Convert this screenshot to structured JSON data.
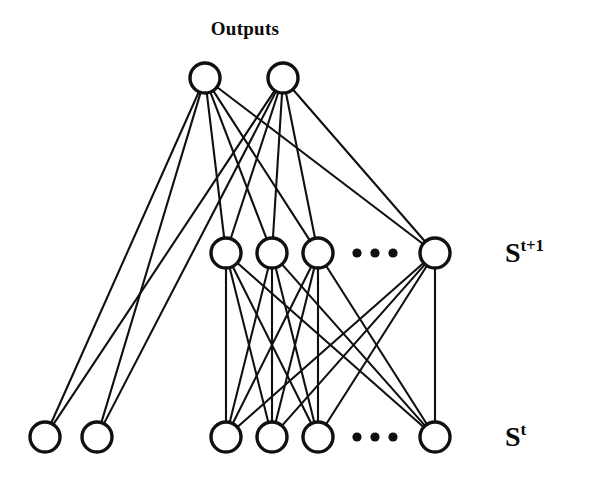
{
  "figure": {
    "kind": "neural-network-diagram",
    "title": "Outputs",
    "background_color": "#ffffff",
    "ink_color": "#101010",
    "width": 591,
    "height": 481
  },
  "labels": {
    "outputs_title": "Outputs",
    "state_next_base": "S",
    "state_next_sup": "t+1",
    "state_current_base": "S",
    "state_current_sup": "t",
    "ellipsis": "• • •"
  },
  "chart_data": {
    "type": "diagram",
    "title": "Outputs",
    "layers": [
      {
        "id": "outputs",
        "label": "Outputs",
        "label_position": "top-center",
        "y": 78,
        "node_radius": 15,
        "nodes": [
          {
            "id": "o1",
            "x": 205,
            "y": 78
          },
          {
            "id": "o2",
            "x": 283,
            "y": 78
          }
        ],
        "ellipsis": null
      },
      {
        "id": "state_next",
        "label": "S^t+1",
        "label_position": "right",
        "y": 253,
        "node_radius": 15,
        "nodes": [
          {
            "id": "h1",
            "x": 226,
            "y": 253
          },
          {
            "id": "h2",
            "x": 272,
            "y": 253
          },
          {
            "id": "h3",
            "x": 318,
            "y": 253
          },
          {
            "id": "h4",
            "x": 435,
            "y": 253
          }
        ],
        "ellipsis": {
          "x": [
            357,
            375,
            393
          ],
          "y": 253,
          "radius": 4.6
        }
      },
      {
        "id": "state_current",
        "label": "S^t",
        "label_position": "right",
        "y": 437,
        "node_radius": 15,
        "nodes": [
          {
            "id": "s1",
            "x": 226,
            "y": 437
          },
          {
            "id": "s2",
            "x": 272,
            "y": 437
          },
          {
            "id": "s3",
            "x": 318,
            "y": 437
          },
          {
            "id": "s4",
            "x": 435,
            "y": 437
          }
        ],
        "ellipsis": {
          "x": [
            357,
            375,
            393
          ],
          "y": 437,
          "radius": 4.6
        }
      },
      {
        "id": "extra_inputs",
        "label": "",
        "label_position": "none",
        "y": 437,
        "node_radius": 15,
        "nodes": [
          {
            "id": "e1",
            "x": 45,
            "y": 437
          },
          {
            "id": "e2",
            "x": 97,
            "y": 437
          }
        ],
        "ellipsis": null
      }
    ],
    "edges": [
      {
        "from": "o1",
        "to": "h1"
      },
      {
        "from": "o1",
        "to": "h2"
      },
      {
        "from": "o1",
        "to": "h3"
      },
      {
        "from": "o1",
        "to": "h4"
      },
      {
        "from": "o1",
        "to": "e1"
      },
      {
        "from": "o1",
        "to": "e2"
      },
      {
        "from": "o2",
        "to": "h1"
      },
      {
        "from": "o2",
        "to": "h2"
      },
      {
        "from": "o2",
        "to": "h3"
      },
      {
        "from": "o2",
        "to": "h4"
      },
      {
        "from": "o2",
        "to": "e1"
      },
      {
        "from": "o2",
        "to": "e2"
      },
      {
        "from": "h1",
        "to": "s1"
      },
      {
        "from": "h1",
        "to": "s2"
      },
      {
        "from": "h1",
        "to": "s3"
      },
      {
        "from": "h1",
        "to": "s4"
      },
      {
        "from": "h2",
        "to": "s1"
      },
      {
        "from": "h2",
        "to": "s2"
      },
      {
        "from": "h2",
        "to": "s3"
      },
      {
        "from": "h2",
        "to": "s4"
      },
      {
        "from": "h3",
        "to": "s1"
      },
      {
        "from": "h3",
        "to": "s2"
      },
      {
        "from": "h3",
        "to": "s3"
      },
      {
        "from": "h3",
        "to": "s4"
      },
      {
        "from": "h4",
        "to": "s1"
      },
      {
        "from": "h4",
        "to": "s2"
      },
      {
        "from": "h4",
        "to": "s3"
      },
      {
        "from": "h4",
        "to": "s4"
      }
    ],
    "title_position": {
      "x": 245,
      "y": 29
    },
    "label_positions": {
      "state_next": {
        "x": 505,
        "y": 252
      },
      "state_current": {
        "x": 505,
        "y": 436
      }
    }
  }
}
